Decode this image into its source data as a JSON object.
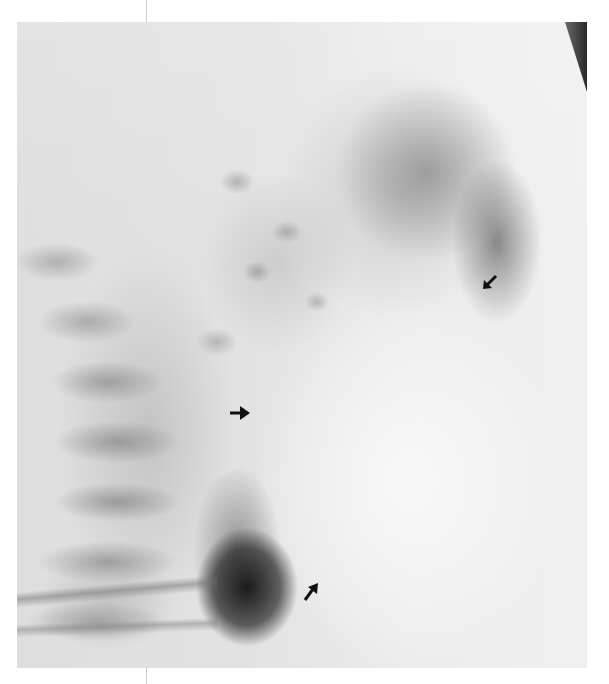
{
  "image": {
    "type": "radiograph",
    "view": "lateral chest",
    "description": "Grayscale lateral chest radiograph with three black arrows marking anatomic findings",
    "colors": {
      "background": "#ffffff",
      "film_light": "#ececec",
      "film_mid": "#9a9a9a",
      "film_dark": "#1a1a1a",
      "arrow": "#111111"
    },
    "arrows": [
      {
        "id": "arrow-upper-right",
        "direction": "down-left",
        "x": 490,
        "y": 282
      },
      {
        "id": "arrow-middle-left",
        "direction": "right",
        "x": 240,
        "y": 413
      },
      {
        "id": "arrow-lower",
        "direction": "up-right",
        "x": 311,
        "y": 592
      }
    ],
    "text": []
  }
}
